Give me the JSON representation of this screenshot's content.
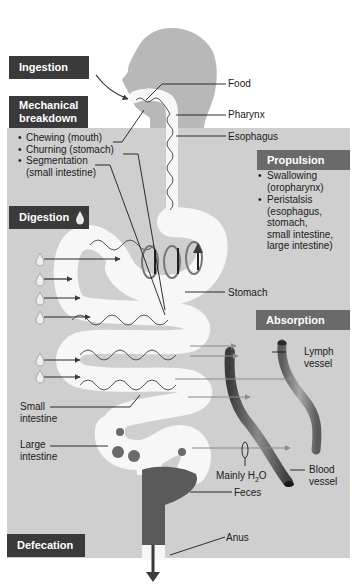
{
  "diagram": {
    "type": "digestive-process-overview",
    "colors": {
      "panel_background": "#cfcfcf",
      "header_dark": "#3a3a3a",
      "header_medium": "#6a6a6a",
      "head_silhouette": "#b8b8b8",
      "gut_lumen": "#f7f7f7",
      "feces": "#5a5a5a",
      "vessel": "#5e5e5e"
    }
  },
  "headers": {
    "ingestion": "Ingestion",
    "mechanical_line1": "Mechanical",
    "mechanical_line2": "breakdown",
    "digestion": "Digestion",
    "propulsion": "Propulsion",
    "absorption": "Absorption",
    "defecation": "Defecation"
  },
  "mechanical_items": [
    {
      "line1": "Chewing (mouth)"
    },
    {
      "line1": "Churning (stomach)"
    },
    {
      "line1": "Segmentation",
      "line2": "(small intestine)"
    }
  ],
  "propulsion_items": [
    {
      "lines": [
        "Swallowing",
        "(oropharynx)"
      ]
    },
    {
      "lines": [
        "Peristalsis",
        "(esophagus,",
        "stomach,",
        "small intestine,",
        "large intestine)"
      ]
    }
  ],
  "labels": {
    "food": "Food",
    "pharynx": "Pharynx",
    "esophagus": "Esophagus",
    "stomach": "Stomach",
    "lymph_line1": "Lymph",
    "lymph_line2": "vessel",
    "small_int_line1": "Small",
    "small_int_line2": "intestine",
    "large_int_line1": "Large",
    "large_int_line2": "intestine",
    "blood_line1": "Blood",
    "blood_line2": "vessel",
    "mainly_prefix": "Mainly H",
    "mainly_sub": "2",
    "mainly_suffix": "O",
    "feces": "Feces",
    "anus": "Anus"
  },
  "icons": {
    "bullet": "•",
    "enzyme_drop": "drop-icon"
  }
}
